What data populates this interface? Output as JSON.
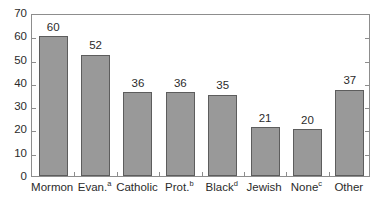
{
  "chart_data": {
    "type": "bar",
    "title": "",
    "subtitle": "",
    "xlabel": "",
    "ylabel": "",
    "categories": [
      "Mormon",
      "Evan.",
      "Catholic",
      "Prot.",
      "Black",
      "Jewish",
      "None",
      "Other"
    ],
    "category_footnotes": [
      "",
      "a",
      "",
      "b",
      "d",
      "",
      "c",
      ""
    ],
    "values": [
      60,
      52,
      36,
      36,
      35,
      21,
      20,
      37
    ],
    "data_labels": [
      "60",
      "52",
      "36",
      "36",
      "35",
      "21",
      "20",
      "37"
    ],
    "ylim": [
      0,
      70
    ],
    "ytick_step": 10,
    "ytick_labels": [
      "70",
      "60",
      "50",
      "40",
      "30",
      "20",
      "10",
      "0"
    ],
    "ytick_values": [
      70,
      60,
      50,
      40,
      30,
      20,
      10,
      0
    ],
    "grid": false,
    "legend": null,
    "legend_position": "none",
    "bar_color": "#999999",
    "bar_edge_color": "#5d5d5d",
    "axis_color": "#8d8d8d",
    "text_color": "#2b2b2b",
    "background_color": "#ffffff"
  }
}
